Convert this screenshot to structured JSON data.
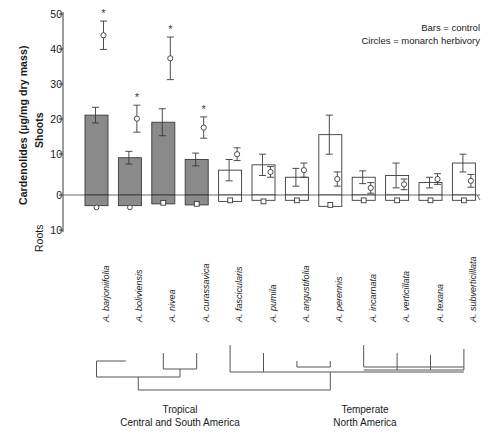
{
  "figure": {
    "axis_title": "Cardenolides (µg/mg dry mass)",
    "shoots_label": "Shoots",
    "roots_label": "Roots",
    "legend": [
      "Bars = control",
      "Circles = monarch herbivory"
    ],
    "region_left": [
      "Tropical",
      "Central and South America"
    ],
    "region_right": [
      "Temperate",
      "North America"
    ],
    "significance_marker": "*"
  },
  "chart_data": {
    "type": "bar",
    "title": "",
    "xlabel": "",
    "ylabel": "Cardenolides (µg/mg dry mass)",
    "ylim": [
      -10,
      50
    ],
    "yticks": [
      50,
      40,
      30,
      20,
      10,
      0,
      10
    ],
    "ytick_labels": [
      "50",
      "40",
      "30",
      "20",
      "10",
      "0",
      "10"
    ],
    "grid": false,
    "legend_position": "top-right",
    "categories": [
      "A. barjoniifolia",
      "A. boliviensis",
      "A. nivea",
      "A. curassavica",
      "A. fascicularis",
      "A. pumila",
      "A. angustifolia",
      "A. perennis",
      "A. incarnata",
      "A. verticillata",
      "A. texana",
      "A. subverticillata"
    ],
    "series": [
      {
        "name": "Shoots control (bars)",
        "values": [
          22.5,
          10.5,
          20.5,
          10.0,
          7.0,
          8.5,
          5.0,
          17.0,
          5.0,
          5.5,
          3.5,
          9.0
        ],
        "errors": [
          2.2,
          1.8,
          3.8,
          1.8,
          3.0,
          3.0,
          2.5,
          5.5,
          1.8,
          3.5,
          1.5,
          2.5
        ],
        "filled": [
          true,
          true,
          true,
          true,
          false,
          false,
          false,
          false,
          false,
          false,
          false,
          false
        ]
      },
      {
        "name": "Shoots monarch herbivory (circles)",
        "values": [
          45.0,
          21.5,
          38.5,
          19.0,
          11.5,
          6.5,
          7.0,
          4.5,
          2.0,
          3.0,
          4.5,
          4.0
        ],
        "errors": [
          4.0,
          3.8,
          6.0,
          3.0,
          1.8,
          1.5,
          2.0,
          2.0,
          1.5,
          1.5,
          1.5,
          1.8
        ]
      },
      {
        "name": "Roots control (bars below zero)",
        "values": [
          -3.0,
          -3.0,
          -2.5,
          -2.8,
          -1.8,
          -1.5,
          -1.5,
          -3.2,
          -1.5,
          -1.5,
          -1.5,
          -1.5
        ]
      },
      {
        "name": "Roots monarch herbivory (squares/circles below zero)",
        "values": [
          -3.5,
          -3.5,
          -2.2,
          -2.5,
          -1.5,
          -1.8,
          -1.5,
          -2.8,
          -1.5,
          -1.5,
          -1.5,
          -1.5
        ]
      }
    ],
    "significance": [
      true,
      true,
      true,
      true,
      false,
      false,
      false,
      false,
      false,
      false,
      false,
      false
    ],
    "shaded_bars": [
      true,
      true,
      true,
      true,
      false,
      false,
      false,
      false,
      false,
      false,
      false,
      false
    ]
  }
}
